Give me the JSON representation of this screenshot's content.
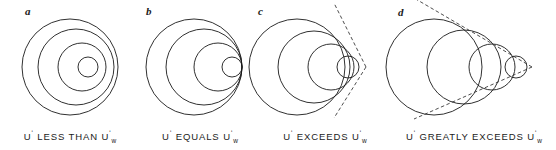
{
  "figure": {
    "background_color": "#ffffff",
    "stroke_color": "#1a1a1a",
    "dash_color": "#3a3a3a"
  },
  "panels": [
    {
      "letter": "a",
      "caption_prefix": "U",
      "caption_middle": " LESS THAN U",
      "caption_subscript": "w",
      "caption_full": "U' LESS THAN U'w",
      "condition": "subsonic",
      "description": "Concentric circles, source speed less than wave speed",
      "has_tangent": false,
      "circles": [
        {
          "cx": 70,
          "cy": 67,
          "r": 48
        },
        {
          "cx": 76,
          "cy": 67,
          "r": 38
        },
        {
          "cx": 82,
          "cy": 67,
          "r": 24
        },
        {
          "cx": 88,
          "cy": 67,
          "r": 10
        }
      ]
    },
    {
      "letter": "b",
      "caption_prefix": "U",
      "caption_middle": " EQUALS U",
      "caption_subscript": "w",
      "caption_full": "U' EQUALS U'w",
      "condition": "sonic",
      "description": "Circles tangent at a common point, source speed equals wave speed",
      "has_tangent": false,
      "circles": [
        {
          "cx": 58,
          "cy": 67,
          "r": 48
        },
        {
          "cx": 68,
          "cy": 67,
          "r": 38
        },
        {
          "cx": 82,
          "cy": 67,
          "r": 24
        },
        {
          "cx": 96,
          "cy": 67,
          "r": 10
        }
      ]
    },
    {
      "letter": "c",
      "caption_prefix": "U",
      "caption_middle": " EXCEEDS U",
      "caption_subscript": "w",
      "caption_full": "U' EXCEEDS U'w",
      "condition": "supersonic",
      "description": "Circles with common tangent forming a narrow Mach cone",
      "has_tangent": true,
      "mach_angle_deg": 42,
      "apex": {
        "x": 114,
        "y": 67
      },
      "circles": [
        {
          "cx": 45,
          "cy": 67,
          "r": 48
        },
        {
          "cx": 62,
          "cy": 67,
          "r": 36
        },
        {
          "cx": 79,
          "cy": 67,
          "r": 23
        },
        {
          "cx": 96,
          "cy": 67,
          "r": 11
        }
      ]
    },
    {
      "letter": "d",
      "caption_prefix": "U",
      "caption_middle": " GREATLY EXCEEDS U",
      "caption_subscript": "w",
      "caption_full": "U' GREATLY EXCEEDS U'w",
      "condition": "hypersonic",
      "description": "Widely separated circles with a shallow Mach cone",
      "has_tangent": true,
      "mach_angle_deg": 22,
      "apex": {
        "x": 140,
        "y": 67
      },
      "circles": [
        {
          "cx": 42,
          "cy": 67,
          "r": 48
        },
        {
          "cx": 72,
          "cy": 67,
          "r": 37
        },
        {
          "cx": 100,
          "cy": 67,
          "r": 23
        },
        {
          "cx": 124,
          "cy": 67,
          "r": 11
        }
      ]
    }
  ]
}
